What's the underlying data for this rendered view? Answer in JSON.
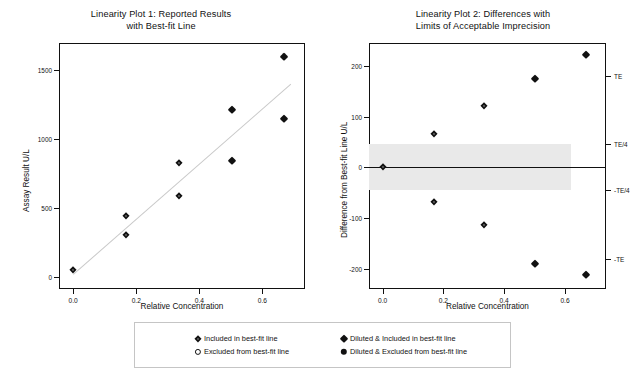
{
  "chart_data": [
    {
      "type": "scatter",
      "id": "linearity-plot-1",
      "title_line1": "Linearity Plot 1:  Reported Results",
      "title_line2": "with Best-fit Line",
      "xlabel": "Relative Concentration",
      "ylabel": "Assay Result U/L",
      "xlim": [
        -0.045,
        0.735
      ],
      "ylim": [
        -90,
        1700
      ],
      "xticks": [
        0.0,
        0.2,
        0.4,
        0.6
      ],
      "xticklabels": [
        "0.0",
        "0.2",
        "0.4",
        "0.6"
      ],
      "yticks": [
        0,
        500,
        1000,
        1500
      ],
      "yticklabels": [
        "0",
        "500",
        "1000",
        "1500"
      ],
      "grid": false,
      "bestfit_line": {
        "color": "#c9c9c9",
        "x0": 0.0,
        "y0": 20,
        "x1": 0.69,
        "y1": 1405
      },
      "series": [
        {
          "name": "Included in best-fit line",
          "marker": "diamond-open",
          "points": [
            {
              "x": 0.0,
              "y": 45
            },
            {
              "x": 0.168,
              "y": 440
            },
            {
              "x": 0.168,
              "y": 300
            },
            {
              "x": 0.335,
              "y": 825
            },
            {
              "x": 0.335,
              "y": 585
            }
          ]
        },
        {
          "name": "Excluded from best-fit line",
          "marker": "circle-open",
          "points": []
        },
        {
          "name": "Diluted & Included in best-fit line",
          "marker": "diamond-filled",
          "points": [
            {
              "x": 0.502,
              "y": 1215
            },
            {
              "x": 0.502,
              "y": 845
            },
            {
              "x": 0.668,
              "y": 1600
            },
            {
              "x": 0.668,
              "y": 1150
            }
          ]
        },
        {
          "name": "Diluted & Excluded from best-fit line",
          "marker": "circle-filled",
          "points": []
        }
      ]
    },
    {
      "type": "scatter",
      "id": "linearity-plot-2",
      "title_line1": "Linearity Plot 2: Differences with",
      "title_line2": "Limits of Acceptable Imprecision",
      "xlabel": "Relative Concentration",
      "ylabel": "Difference from Best-fit Line U/L",
      "xlim": [
        -0.045,
        0.735
      ],
      "ylim": [
        -240,
        245
      ],
      "xticks": [
        0.0,
        0.2,
        0.4,
        0.6
      ],
      "xticklabels": [
        "0.0",
        "0.2",
        "0.4",
        "0.6"
      ],
      "yticks": [
        -200,
        -100,
        0,
        100,
        200
      ],
      "yticklabels": [
        "-200",
        "-100",
        "0",
        "100",
        "200"
      ],
      "right_axis_ticks": [
        180,
        45,
        -45,
        -180
      ],
      "right_axis_labels": [
        "TE",
        "TE/4",
        "-TE/4",
        "-TE"
      ],
      "grid": false,
      "zero_line": {
        "y": 0,
        "color": "#111111"
      },
      "acceptance_band": {
        "label": "Limits of Acceptable Imprecision",
        "upper": 45,
        "lower": -45,
        "x_start": -0.045,
        "x_end": 0.62,
        "color": "#e9e9e9"
      },
      "series": [
        {
          "name": "Included in best-fit line",
          "marker": "diamond-open",
          "points": [
            {
              "x": 0.0,
              "y": 0
            },
            {
              "x": 0.168,
              "y": 66
            },
            {
              "x": 0.168,
              "y": -69
            },
            {
              "x": 0.335,
              "y": 120
            },
            {
              "x": 0.335,
              "y": -114
            }
          ]
        },
        {
          "name": "Excluded from best-fit line",
          "marker": "circle-open",
          "points": []
        },
        {
          "name": "Diluted & Included in best-fit line",
          "marker": "diamond-filled",
          "points": [
            {
              "x": 0.502,
              "y": 175
            },
            {
              "x": 0.502,
              "y": -190
            },
            {
              "x": 0.668,
              "y": 221
            },
            {
              "x": 0.668,
              "y": -213
            }
          ]
        },
        {
          "name": "Diluted & Excluded from best-fit line",
          "marker": "circle-filled",
          "points": []
        }
      ]
    }
  ],
  "plot1": {
    "title_line1": "Linearity Plot 1:  Reported Results",
    "title_line2": "with Best-fit Line",
    "xlabel": "Relative Concentration",
    "ylabel": "Assay Result U/L",
    "xticklabels": [
      "0.0",
      "0.2",
      "0.4",
      "0.6"
    ],
    "yticklabels": [
      "1500",
      "1000",
      "500",
      "0"
    ]
  },
  "plot2": {
    "title_line1": "Linearity Plot 2: Differences with",
    "title_line2": "Limits of Acceptable Imprecision",
    "xlabel": "Relative Concentration",
    "ylabel": "Difference from Best-fit Line U/L",
    "xticklabels": [
      "0.0",
      "0.2",
      "0.4",
      "0.6"
    ],
    "yticklabels": [
      "200",
      "100",
      "0",
      "-100",
      "-200"
    ],
    "rightticklabels": [
      "TE",
      "TE/4",
      "-TE/4",
      "-TE"
    ]
  },
  "legend": {
    "items": [
      {
        "marker": "diamond-open",
        "label": "Included in best-fit line"
      },
      {
        "marker": "circle-open",
        "label": "Excluded from best-fit line"
      },
      {
        "marker": "diamond-filled",
        "label": "Diluted & Included in best-fit line"
      },
      {
        "marker": "circle-filled",
        "label": "Diluted & Excluded from best-fit line"
      }
    ]
  },
  "colors": {
    "frame": "#111111",
    "fitline": "#c9c9c9",
    "band": "#e9e9e9",
    "marker": "#111111",
    "background": "#ffffff"
  }
}
